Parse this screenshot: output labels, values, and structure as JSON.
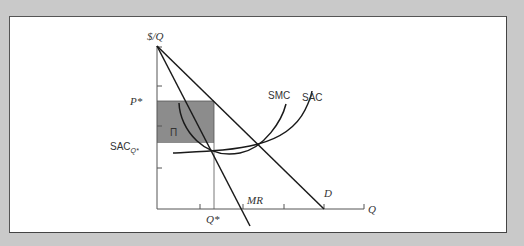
{
  "figure": {
    "y_axis_label": "$/Q",
    "x_axis_label": "Q",
    "price_label": "P*",
    "sac_label_main": "SAC",
    "sac_label_sub": "Q*",
    "quantity_label": "Q*",
    "profit_label": "Π",
    "curves": {
      "smc": "SMC",
      "sac": "SAC",
      "mr": "MR",
      "demand": "D"
    },
    "colors": {
      "profit_area": "#8c8c8c",
      "lines": "#1a1a1a",
      "axes": "#555555",
      "background": "#c9c9c9"
    }
  }
}
